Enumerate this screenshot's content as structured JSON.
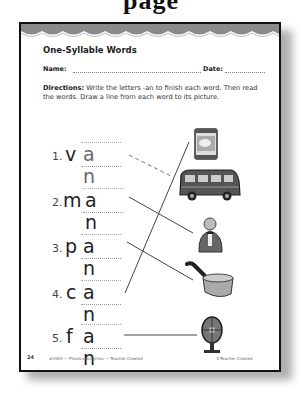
{
  "header": {
    "cropped_title": "page"
  },
  "worksheet": {
    "title": "One-Syllable Words",
    "name_label": "Name:",
    "date_label": "Date:",
    "directions_label": "Directions:",
    "directions_text": " Write the letters -an to finish each word. Then read the words. Draw a line from each word to its picture.",
    "items": [
      {
        "number": "1.",
        "first": "v",
        "ending": "a n",
        "picture": "can",
        "line_style": "dashed"
      },
      {
        "number": "2.",
        "first": "m",
        "ending": "a n",
        "picture": "man",
        "line_style": "solid"
      },
      {
        "number": "3.",
        "first": "p",
        "ending": "a n",
        "picture": "pan",
        "line_style": "solid"
      },
      {
        "number": "4.",
        "first": "c",
        "ending": "a n",
        "picture": "can",
        "line_style": "solid"
      },
      {
        "number": "5.",
        "first": "f",
        "ending": "a n",
        "picture": "fan",
        "line_style": "solid"
      }
    ],
    "pictures": [
      "can",
      "van",
      "man",
      "pan",
      "fan"
    ],
    "footer": {
      "page_number": "24",
      "left_text": "#3929 — Phonics activities — Teacher Created",
      "right_text": "©Teacher Created"
    }
  },
  "colors": {
    "border": "#111111",
    "scallop": "#8a8a8a",
    "text": "#222222"
  }
}
